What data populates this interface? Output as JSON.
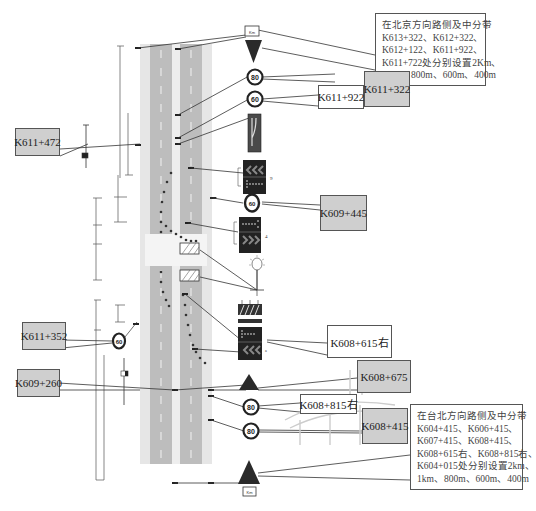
{
  "diagram": {
    "type": "highway construction zone traffic sign layout",
    "callouts": [
      {
        "id": "k611_322",
        "label": "K611+322",
        "style": "gray"
      },
      {
        "id": "k611_922",
        "label": "K611+922",
        "style": "white"
      },
      {
        "id": "k611_472",
        "label": "K611+472",
        "style": "gray"
      },
      {
        "id": "k609_445",
        "label": "K609+445",
        "style": "gray"
      },
      {
        "id": "k611_352",
        "label": "K611+352",
        "style": "gray"
      },
      {
        "id": "k608_615r",
        "label": "K608+615右",
        "style": "white"
      },
      {
        "id": "k609_260",
        "label": "K609+260",
        "style": "gray"
      },
      {
        "id": "k608_675",
        "label": "K608+675",
        "style": "gray"
      },
      {
        "id": "k608_815r",
        "label": "K608+815右",
        "style": "white"
      },
      {
        "id": "k608_415",
        "label": "K608+415",
        "style": "gray"
      }
    ],
    "notes": {
      "top": {
        "lines": [
          "在北京方向路侧及中分带",
          "K613+322、K612+322、",
          "K612+122、K611+922、",
          "K611+722处分别设置2Km、",
          "1Km、800m、600m、400m"
        ]
      },
      "bottom": {
        "lines": [
          "在台北方向路侧及中分带",
          "K604+415、K606+415、",
          "K607+415、K608+415、",
          "K608+615右、K608+815右、",
          "K604+015处分别设置2km、",
          "1km、800m、600m、400m"
        ]
      }
    },
    "signs": [
      {
        "name": "distance-plate-top",
        "text": "Km"
      },
      {
        "name": "warning-triangle-top"
      },
      {
        "name": "speed-limit-80-a",
        "text": "80"
      },
      {
        "name": "speed-limit-60-a",
        "text": "60"
      },
      {
        "name": "lane-merge-sign"
      },
      {
        "name": "chevron-arrow-board-a",
        "side_label": "9"
      },
      {
        "name": "speed-limit-60-b",
        "text": "60"
      },
      {
        "name": "chevron-arrow-board-b",
        "side_label": "4"
      },
      {
        "name": "warning-light"
      },
      {
        "name": "barrier-arrow-board"
      },
      {
        "name": "warning-triangle-bottom"
      },
      {
        "name": "speed-limit-80-b",
        "text": "80"
      },
      {
        "name": "speed-limit-80-c",
        "text": "80"
      },
      {
        "name": "warning-triangle-end"
      },
      {
        "name": "distance-plate-bottom",
        "text": "Km"
      },
      {
        "name": "speed-limit-60-left",
        "text": "60"
      }
    ],
    "colors": {
      "road": "#bdbdbd",
      "shoulder": "#dcdcdc",
      "median": "#e8e8e8",
      "callout_gray": "#cfcfcf",
      "sign_dark": "#2a2a2a",
      "line": "#333333"
    }
  }
}
